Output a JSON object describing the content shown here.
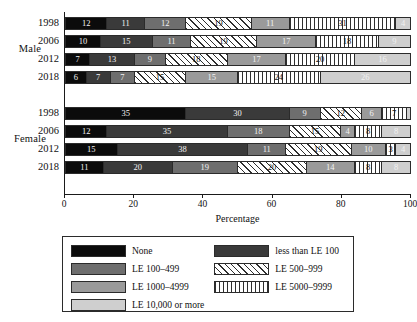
{
  "chart_data": {
    "type": "bar",
    "orientation": "horizontal",
    "stacked": true,
    "stack_mode": "percent",
    "title": "",
    "xlabel": "Percentage",
    "ylabel": "",
    "xlim": [
      0,
      100
    ],
    "xticks": [
      0,
      20,
      40,
      60,
      80,
      100
    ],
    "grid": false,
    "legend_position": "bottom",
    "categories": [
      "None",
      "less than LE 100",
      "LE 100–499",
      "LE 500–999",
      "LE 1000–4999",
      "LE 5000–9999",
      "LE 10,000 or more"
    ],
    "category_fills": [
      "solid-black",
      "solid-dark-gray",
      "solid-medium-gray",
      "diagonal-hatch",
      "solid-gray",
      "vertical-stripes",
      "solid-light-gray"
    ],
    "category_colors": [
      "#0b0b0b",
      "#3a3a3a",
      "#6e6e6e",
      "#ffffff",
      "#9a9a9a",
      "#ffffff",
      "#cfcfcf"
    ],
    "groups": [
      {
        "label": "Male",
        "bars": [
          {
            "label": "1998",
            "values": [
              12,
              11,
              12,
              19,
              11,
              31,
              4
            ]
          },
          {
            "label": "2006",
            "values": [
              10,
              15,
              11,
              19,
              17,
              18,
              9
            ]
          },
          {
            "label": "2012",
            "values": [
              7,
              13,
              9,
              18,
              17,
              20,
              16
            ]
          },
          {
            "label": "2018",
            "values": [
              6,
              7,
              7,
              15,
              15,
              24,
              26
            ]
          }
        ]
      },
      {
        "label": "Female",
        "bars": [
          {
            "label": "1998",
            "values": [
              35,
              30,
              9,
              12,
              6,
              7,
              1
            ]
          },
          {
            "label": "2006",
            "values": [
              12,
              35,
              18,
              15,
              4,
              8,
              8
            ]
          },
          {
            "label": "2012",
            "values": [
              15,
              38,
              11,
              19,
              10,
              3,
              4
            ]
          },
          {
            "label": "2018",
            "values": [
              11,
              20,
              19,
              20,
              14,
              8,
              8
            ]
          }
        ]
      }
    ]
  },
  "legend": {
    "items": [
      {
        "label": "None",
        "fill": "solid-black"
      },
      {
        "label": "less than LE 100",
        "fill": "solid-dark-gray"
      },
      {
        "label": "LE 100–499",
        "fill": "solid-medium-gray"
      },
      {
        "label": "LE 500–999",
        "fill": "diagonal-hatch"
      },
      {
        "label": "LE 1000–4999",
        "fill": "solid-gray"
      },
      {
        "label": "LE 5000–9999",
        "fill": "vertical-stripes"
      },
      {
        "label": "LE 10,000 or more",
        "fill": "solid-light-gray"
      }
    ]
  }
}
